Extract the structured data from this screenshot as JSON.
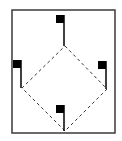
{
  "diagram": {
    "type": "baseball-diamond-flags",
    "colors": {
      "background": "#ffffff",
      "border": "#3a3a3a",
      "flag": "#000000",
      "dashed_line": "#333333"
    },
    "frame": {
      "x": 12,
      "y": 10,
      "width": 103,
      "height": 123
    },
    "diamond": {
      "top": [
        65,
        46
      ],
      "right": [
        107,
        89
      ],
      "bottom": [
        65,
        131
      ],
      "left": [
        22,
        88
      ]
    },
    "flags": [
      {
        "name": "top-flag",
        "square": [
          56,
          15,
          8,
          8
        ],
        "pole_x": 64,
        "pole_top": 15,
        "pole_bottom": 46
      },
      {
        "name": "left-flag",
        "square": [
          13,
          60,
          8,
          8
        ],
        "pole_x": 21,
        "pole_top": 60,
        "pole_bottom": 88
      },
      {
        "name": "right-flag",
        "square": [
          98,
          61,
          8,
          8
        ],
        "pole_x": 106,
        "pole_top": 61,
        "pole_bottom": 89
      },
      {
        "name": "bottom-flag",
        "square": [
          56,
          105,
          8,
          8
        ],
        "pole_x": 64,
        "pole_top": 105,
        "pole_bottom": 131
      }
    ]
  }
}
